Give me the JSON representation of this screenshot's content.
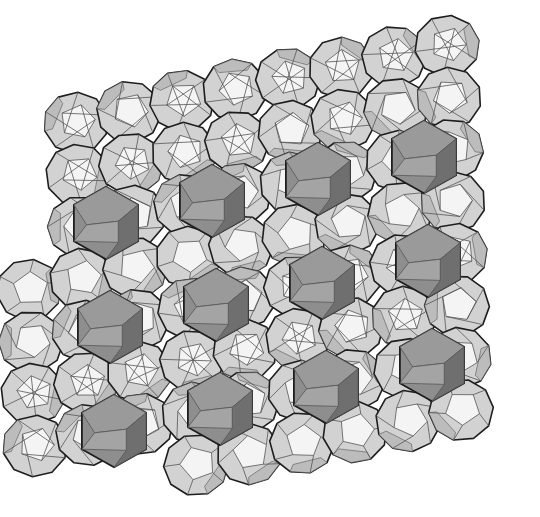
{
  "figure": {
    "colors": {
      "background": "#ffffff",
      "edge": "#1e1e1e",
      "inner_edge": "#555555",
      "face_light": "#f4f4f4",
      "face_mid": "#d2d2d2",
      "face_side": "#bcbcbc",
      "face_dark": "#8e8e8e",
      "face_darker": "#6f6f6f"
    },
    "lattice": {
      "origin": [
        78,
        175
      ],
      "col_step": [
        106,
        -22
      ],
      "row_step": [
        4,
        104
      ],
      "cols": 4,
      "rows": 3
    },
    "cell_radius": 36
  }
}
